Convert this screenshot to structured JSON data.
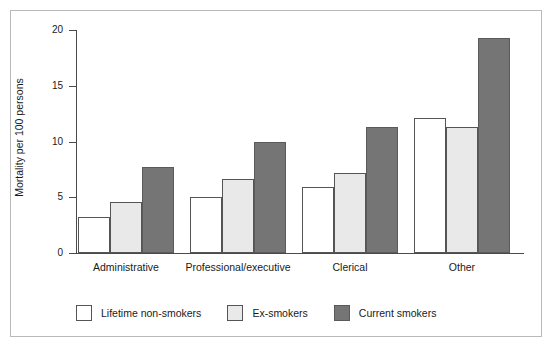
{
  "chart_data": {
    "type": "bar",
    "title": "",
    "xlabel": "",
    "ylabel": "Mortality per 100 persons",
    "ylim": [
      0,
      20
    ],
    "yticks": [
      0,
      5,
      10,
      15,
      20
    ],
    "grid": false,
    "legend_position": "bottom-left",
    "categories": [
      "Administrative",
      "Professional/executive",
      "Clerical",
      "Other"
    ],
    "series": [
      {
        "name": "Lifetime non-smokers",
        "color": "#ffffff",
        "values": [
          3.2,
          5.0,
          5.9,
          12.1
        ]
      },
      {
        "name": "Ex-smokers",
        "color": "#e9e9e9",
        "values": [
          4.6,
          6.6,
          7.2,
          11.3
        ]
      },
      {
        "name": "Current smokers",
        "color": "#757575",
        "values": [
          7.7,
          10.0,
          11.3,
          19.3
        ]
      }
    ]
  },
  "axis": {
    "y_title": "Mortality per 100 persons",
    "y_tick_labels": [
      "0",
      "5",
      "10",
      "15",
      "20"
    ]
  },
  "legend": {
    "items": [
      {
        "label": "Lifetime non-smokers"
      },
      {
        "label": "Ex-smokers"
      },
      {
        "label": "Current smokers"
      }
    ]
  },
  "categories": [
    "Administrative",
    "Professional/executive",
    "Clerical",
    "Other"
  ]
}
